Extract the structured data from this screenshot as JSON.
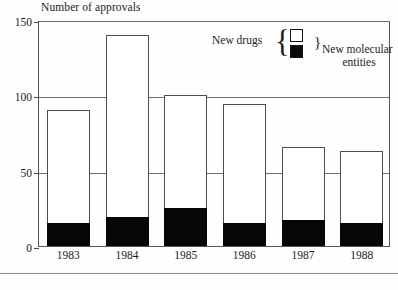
{
  "chart_data": {
    "type": "bar",
    "stacked": true,
    "title": "",
    "ylabel": "Number of approvals",
    "xlabel": "",
    "categories": [
      "1983",
      "1984",
      "1985",
      "1986",
      "1987",
      "1988"
    ],
    "series": [
      {
        "name": "New drugs",
        "swatch": "white",
        "values": [
          90,
          140,
          100,
          94,
          66,
          63
        ]
      },
      {
        "name": "New molecular entities",
        "swatch": "black",
        "values": [
          15,
          19,
          25,
          15,
          17,
          15
        ]
      }
    ],
    "ylim": [
      0,
      150
    ],
    "yticks": [
      0,
      50,
      100,
      150
    ],
    "ytick_labels": [
      "0",
      "50",
      "100",
      "150"
    ],
    "grid": true,
    "legend_position": "top-right"
  },
  "axis": {
    "y_title": "Number of approvals",
    "ticks": [
      {
        "label": "150",
        "value": 150
      },
      {
        "label": "100",
        "value": 100
      },
      {
        "label": "50",
        "value": 50
      },
      {
        "label": "0",
        "value": 0
      }
    ]
  },
  "bars": [
    {
      "year": "1983",
      "total": 90,
      "nme": 15
    },
    {
      "year": "1984",
      "total": 140,
      "nme": 19
    },
    {
      "year": "1985",
      "total": 100,
      "nme": 25
    },
    {
      "year": "1986",
      "total": 94,
      "nme": 15
    },
    {
      "year": "1987",
      "total": 66,
      "nme": 17
    },
    {
      "year": "1988",
      "total": 63,
      "nme": 15
    }
  ],
  "legend": {
    "left_label": "New drugs",
    "brace_open": "{",
    "brace_close": "}",
    "right_label_line1": "New molecular",
    "right_label_line2": "entities",
    "swatch_new_drugs_color": "#ffffff",
    "swatch_nme_color": "#0a0a0a"
  }
}
